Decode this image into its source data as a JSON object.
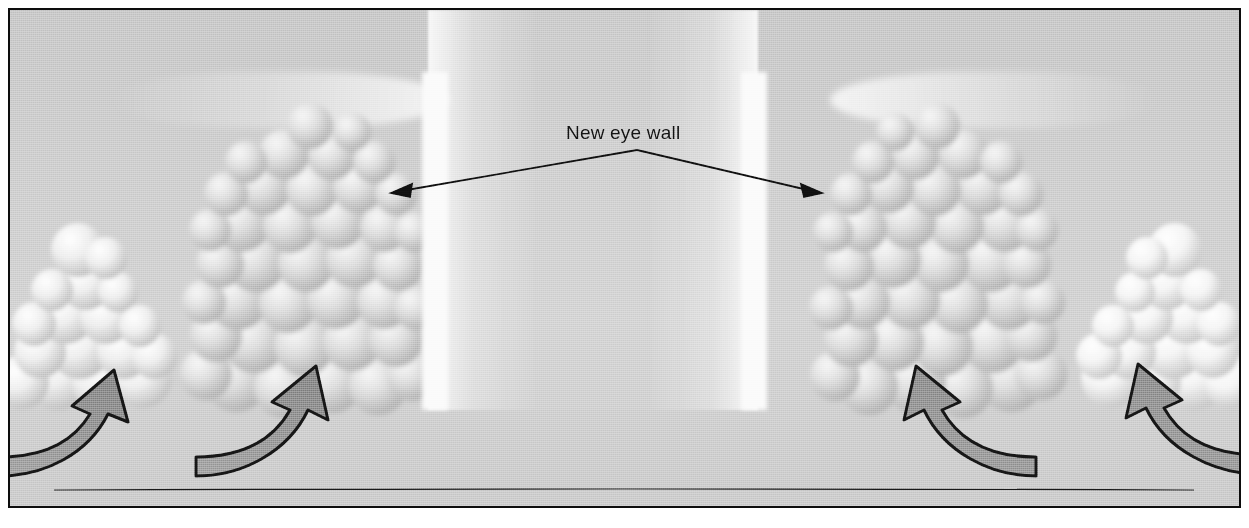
{
  "figure": {
    "background_color": "#c9c9c9",
    "border_color": "#0d0d0d",
    "eye_color": "#f4f4f4"
  },
  "annotations": [
    {
      "id": "new-eye-wall",
      "label": "New eye wall",
      "text_color": "#111111",
      "font_size_px": 19,
      "apex": {
        "x": 635,
        "y": 148
      },
      "points_to": [
        {
          "x": 395,
          "y": 190
        },
        {
          "x": 810,
          "y": 190
        }
      ],
      "arrow_style": "double-headed"
    }
  ],
  "cloud_features": [
    {
      "id": "outer-band-left",
      "kind": "cumulus-cluster",
      "side": "left",
      "x": 0,
      "y": 200,
      "width": 170,
      "height": 210
    },
    {
      "id": "eyewall-tower-left",
      "kind": "convective-tower",
      "side": "left",
      "x": 180,
      "y": 80,
      "width": 245,
      "height": 320
    },
    {
      "id": "inner-eyewall-edge-left",
      "kind": "scalloped-wall",
      "x": 412,
      "y": 62,
      "width": 26,
      "height": 338
    },
    {
      "id": "eye",
      "kind": "clear-eye",
      "x": 438,
      "y": 0,
      "width": 295,
      "height": 400
    },
    {
      "id": "inner-eyewall-edge-right",
      "kind": "scalloped-wall",
      "x": 731,
      "y": 62,
      "width": 26,
      "height": 338
    },
    {
      "id": "eyewall-tower-right",
      "kind": "convective-tower",
      "side": "right",
      "x": 805,
      "y": 80,
      "width": 245,
      "height": 320
    },
    {
      "id": "outer-band-right",
      "kind": "cumulus-cluster",
      "side": "right",
      "x": 1065,
      "y": 200,
      "width": 175,
      "height": 210
    },
    {
      "id": "anvil-outflow-left",
      "kind": "anvil-cirrus",
      "x": 100,
      "y": 62,
      "width": 340,
      "height": 56
    },
    {
      "id": "anvil-outflow-right",
      "kind": "anvil-cirrus",
      "x": 820,
      "y": 62,
      "width": 330,
      "height": 56
    }
  ],
  "inflow_arrows": [
    {
      "id": "inflow-arrow-outer-left",
      "direction": "up-right",
      "tip": {
        "x": 96,
        "y": 398
      },
      "tail": {
        "x": 0,
        "y": 462
      }
    },
    {
      "id": "inflow-arrow-inner-left",
      "direction": "up-right",
      "tip": {
        "x": 300,
        "y": 394
      },
      "tail": {
        "x": 196,
        "y": 462
      }
    },
    {
      "id": "inflow-arrow-inner-right",
      "direction": "up-left",
      "tip": {
        "x": 925,
        "y": 394
      },
      "tail": {
        "x": 1030,
        "y": 462
      }
    },
    {
      "id": "inflow-arrow-outer-right",
      "direction": "up-left",
      "tip": {
        "x": 1155,
        "y": 392
      },
      "tail": {
        "x": 1249,
        "y": 462
      }
    },
    {
      "id": "arrow-fill",
      "color": "#8e8e8e",
      "outline_color": "#141414"
    }
  ],
  "ground_line": {
    "x_start": 44,
    "x_end": 1184,
    "y": 478,
    "color": "#141414"
  }
}
